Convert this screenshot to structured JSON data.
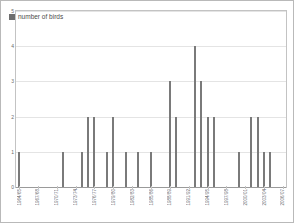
{
  "legend": {
    "label": "number of birds",
    "color": "#6e6e6e",
    "position": "top-left-inside"
  },
  "axes": {
    "y_ticks": [
      "0",
      "1",
      "2",
      "3",
      "4",
      "5"
    ],
    "x_tick_step": 3
  },
  "chart_data": {
    "type": "bar",
    "title": "",
    "xlabel": "",
    "ylabel": "",
    "ylim": [
      0,
      5
    ],
    "grid": true,
    "series": [
      {
        "name": "number of birds",
        "color": "#7a7a7a"
      }
    ],
    "categories": [
      "1964/65",
      "1965/66",
      "1966/67",
      "1967/68",
      "1968/69",
      "1969/70",
      "1970/71",
      "1971/72",
      "1972/73",
      "1973/74",
      "1974/75",
      "1975/76",
      "1976/77",
      "1977/78",
      "1978/79",
      "1979/80",
      "1980/81",
      "1981/82",
      "1982/83",
      "1983/84",
      "1984/85",
      "1985/86",
      "1986/87",
      "1987/88",
      "1988/89",
      "1989/90",
      "1990/91",
      "1991/92",
      "1992/93",
      "1993/94",
      "1994/95",
      "1995/96",
      "1996/97",
      "1997/98",
      "1998/99",
      "1999/00",
      "2000/01",
      "2001/02",
      "2002/03",
      "2003/04",
      "2004/05",
      "2005/06",
      "2006/07"
    ],
    "tick_labels": [
      "1964/65",
      "1967/68",
      "1970/71",
      "1973/74",
      "1976/77",
      "1979/80",
      "1982/83",
      "1985/86",
      "1988/89",
      "1991/92",
      "1994/95",
      "1997/98",
      "2000/01",
      "2003/04",
      "2006/07"
    ],
    "values": [
      1,
      0,
      0,
      0,
      0,
      0,
      0,
      1,
      0,
      0,
      1,
      2,
      2,
      0,
      1,
      2,
      0,
      1,
      0,
      1,
      0,
      1,
      0,
      0,
      3,
      2,
      0,
      0,
      4,
      3,
      2,
      2,
      0,
      0,
      0,
      1,
      0,
      2,
      2,
      1,
      1,
      0,
      0
    ],
    "bar_positions_px": [
      22,
      66,
      80,
      88,
      94,
      102,
      112,
      120,
      128,
      136,
      146,
      154,
      160,
      166,
      186,
      196,
      202,
      208,
      228,
      236
    ],
    "notable": {
      "max_value": 4,
      "max_category": "1992/93"
    }
  }
}
